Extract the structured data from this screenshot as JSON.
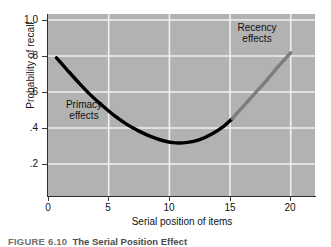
{
  "figure": {
    "caption_label": "FIGURE 6.10",
    "caption_title": "The Serial Position Effect"
  },
  "chart_data": {
    "type": "line",
    "title": "",
    "xlabel": "Serial position of items",
    "ylabel": "Probability of recall",
    "xlim": [
      0,
      22
    ],
    "ylim": [
      0,
      1.08
    ],
    "xticks": [
      0,
      5,
      10,
      15,
      20
    ],
    "xtick_labels": [
      "0",
      "5",
      "10",
      "15",
      "20"
    ],
    "yticks": [
      0.2,
      0.4,
      0.6,
      0.8,
      1.0
    ],
    "ytick_labels": [
      ".2",
      ".4",
      ".6",
      ".8",
      "1.0"
    ],
    "grid": true,
    "grid_color": "#f2f2f2",
    "plot_background": "#b2b2b2",
    "legend_position": "none",
    "series": [
      {
        "name": "Primacy effects",
        "color": "#000000",
        "x": [
          0.7,
          1.5,
          2.5,
          3.5,
          4.5,
          5.5,
          6.5,
          7.5,
          8.5,
          9.5,
          10.5,
          11.5,
          12.5,
          13.5,
          14.5,
          15.2
        ],
        "values": [
          0.82,
          0.755,
          0.675,
          0.6,
          0.535,
          0.475,
          0.425,
          0.385,
          0.352,
          0.328,
          0.315,
          0.318,
          0.335,
          0.368,
          0.415,
          0.46
        ]
      },
      {
        "name": "Recency effects",
        "color": "#7d7d7d",
        "x": [
          15.2,
          16.0,
          17.0,
          18.0,
          19.0,
          20.0
        ],
        "values": [
          0.46,
          0.525,
          0.605,
          0.685,
          0.77,
          0.85
        ]
      }
    ],
    "annotations": [
      {
        "name": "primacy",
        "label_line1": "Primacy",
        "label_line2": "effects"
      },
      {
        "name": "recency",
        "label_line1": "Recency",
        "label_line2": "effects"
      }
    ]
  }
}
